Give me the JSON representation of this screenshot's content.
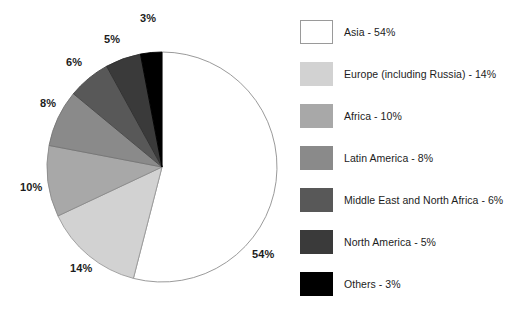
{
  "chart_data": {
    "type": "pie",
    "title": "",
    "subtitle": "",
    "xlabel": "",
    "ylabel": "",
    "grid": false,
    "legend_position": "right",
    "start_angle_deg": 0,
    "direction": "clockwise",
    "units": "percent",
    "total": 100,
    "categories": [
      "Asia",
      "Europe (including Russia)",
      "Africa",
      "Latin America",
      "Middle East and North Africa",
      "North America",
      "Others"
    ],
    "values": [
      54,
      14,
      10,
      8,
      6,
      5,
      3
    ],
    "colors": [
      "#ffffff",
      "#d2d2d2",
      "#a8a8a8",
      "#8a8a8a",
      "#585858",
      "#3a3a3a",
      "#000000"
    ],
    "slices": [
      {
        "label": "Asia",
        "value": 54,
        "data_label": "54%",
        "legend_text": "Asia - 54%",
        "color": "#ffffff",
        "stroke": "#8f8f8f",
        "start_deg": 0,
        "end_deg": 194.4,
        "label_x": 252,
        "label_y": 248
      },
      {
        "label": "Europe (including Russia)",
        "value": 14,
        "data_label": "14%",
        "legend_text": "Europe (including Russia) - 14%",
        "color": "#d2d2d2",
        "stroke": "#9a9a9a",
        "start_deg": 194.4,
        "end_deg": 244.8,
        "label_x": 70,
        "label_y": 262
      },
      {
        "label": "Africa",
        "value": 10,
        "data_label": "10%",
        "legend_text": "Africa - 10%",
        "color": "#a8a8a8",
        "stroke": "#8a8a8a",
        "start_deg": 244.8,
        "end_deg": 280.8,
        "label_x": 20,
        "label_y": 181
      },
      {
        "label": "Latin America",
        "value": 8,
        "data_label": "8%",
        "legend_text": "Latin America - 8%",
        "color": "#8a8a8a",
        "stroke": "#757575",
        "start_deg": 280.8,
        "end_deg": 309.6,
        "label_x": 40,
        "label_y": 97
      },
      {
        "label": "Middle East and North Africa",
        "value": 6,
        "data_label": "6%",
        "legend_text": "Middle East and North Africa - 6%",
        "color": "#585858",
        "stroke": "#4a4a4a",
        "start_deg": 309.6,
        "end_deg": 331.2,
        "label_x": 66,
        "label_y": 56
      },
      {
        "label": "North America",
        "value": 5,
        "data_label": "5%",
        "legend_text": "North America - 5%",
        "color": "#3a3a3a",
        "stroke": "#303030",
        "start_deg": 331.2,
        "end_deg": 349.2,
        "label_x": 104,
        "label_y": 33
      },
      {
        "label": "Others",
        "value": 3,
        "data_label": "3%",
        "legend_text": "Others - 3%",
        "color": "#000000",
        "stroke": "#000000",
        "start_deg": 349.2,
        "end_deg": 360,
        "label_x": 140,
        "label_y": 12
      }
    ],
    "geometry": {
      "center_x": 162,
      "center_y": 167,
      "radius": 115
    }
  },
  "legend": {
    "items": [
      {
        "text": "Asia - 54%",
        "swatch_color": "#ffffff",
        "outlined": true
      },
      {
        "text": "Europe (including Russia) - 14%",
        "swatch_color": "#d2d2d2",
        "outlined": false
      },
      {
        "text": "Africa - 10%",
        "swatch_color": "#a8a8a8",
        "outlined": false
      },
      {
        "text": "Latin America - 8%",
        "swatch_color": "#8a8a8a",
        "outlined": false
      },
      {
        "text": "Middle East and North Africa - 6%",
        "swatch_color": "#585858",
        "outlined": false
      },
      {
        "text": "North America - 5%",
        "swatch_color": "#3a3a3a",
        "outlined": false
      },
      {
        "text": "Others - 3%",
        "swatch_color": "#000000",
        "outlined": false
      }
    ]
  }
}
